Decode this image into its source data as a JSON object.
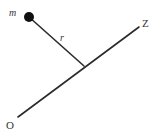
{
  "diagram": {
    "labels": {
      "mass": "m",
      "radius": "r",
      "origin": "O",
      "axis_end": "Z"
    },
    "colors": {
      "line": "#2b2b2b",
      "mass": "#111111",
      "text": "#333333",
      "background": "#ffffff"
    },
    "elements": {
      "axis": {
        "from": [
          18,
          117
        ],
        "to": [
          139,
          27
        ]
      },
      "radius_line": {
        "from": [
          29,
          17
        ],
        "to": [
          84,
          66
        ]
      },
      "mass_point": {
        "center": [
          29,
          17
        ],
        "r": 5
      }
    }
  }
}
